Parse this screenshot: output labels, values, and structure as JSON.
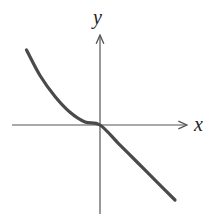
{
  "chart_data": {
    "type": "line",
    "title": "",
    "xlabel": "x",
    "ylabel": "y",
    "xlim": [
      -1,
      1
    ],
    "ylim": [
      -1,
      1
    ],
    "grid": false,
    "legend": "none",
    "series": [
      {
        "name": "f(x)",
        "description": "Curve decreasing and concave up for x<0, flattening to horizontal tangent at origin; straight line with slope -1 for x>0",
        "x": [
          -0.98,
          -0.8,
          -0.6,
          -0.4,
          -0.2,
          0,
          0.25,
          0.5,
          0.75,
          1.0
        ],
        "y": [
          1.0,
          0.66,
          0.38,
          0.17,
          0.04,
          0,
          -0.25,
          -0.5,
          -0.75,
          -1.0
        ]
      }
    ]
  }
}
